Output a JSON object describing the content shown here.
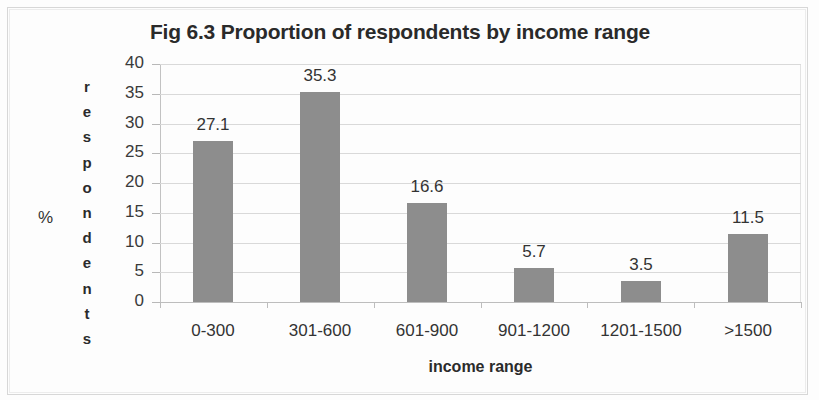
{
  "chart_data": {
    "type": "bar",
    "title": "Fig 6.3 Proportion of respondents by income range",
    "xlabel": "income range",
    "ylabel": "% respondents",
    "ylabel_prefix": "%",
    "ylabel_vertical": "respondents",
    "categories": [
      "0-300",
      "301-600",
      "601-900",
      "901-1200",
      "1201-1500",
      ">1500"
    ],
    "values": [
      27.1,
      35.3,
      16.6,
      5.7,
      3.5,
      11.5
    ],
    "value_labels": [
      "27.1",
      "35.3",
      "16.6",
      "5.7",
      "3.5",
      "11.5"
    ],
    "ylim": [
      0,
      40
    ],
    "yticks": [
      0,
      5,
      10,
      15,
      20,
      25,
      30,
      35,
      40
    ],
    "ytick_labels": [
      "0",
      "5",
      "10",
      "15",
      "20",
      "25",
      "30",
      "35",
      "40"
    ],
    "grid": true,
    "legend": false,
    "bar_color": "#8d8d8d",
    "gridline_color": "#d9d9d9",
    "text_color": "#333333"
  }
}
